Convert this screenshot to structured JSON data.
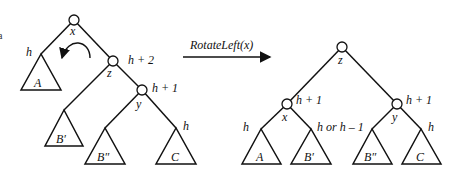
{
  "operation": {
    "label": "RotateLeft(x)",
    "arrow": {
      "x1": 183,
      "y1": 57,
      "x2": 270,
      "y2": 57
    }
  },
  "left_tree": {
    "nodes": [
      {
        "id": "x",
        "label": "x",
        "cx": 74,
        "cy": 20,
        "lx": 70,
        "ly": 35
      },
      {
        "id": "z",
        "label": "z",
        "cx": 113,
        "cy": 61,
        "lx": 107,
        "ly": 77,
        "height": "h + 2",
        "hx": 128,
        "hy": 64
      },
      {
        "id": "y",
        "label": "y",
        "cx": 142,
        "cy": 90,
        "lx": 136,
        "ly": 108,
        "height": "h + 1",
        "hx": 152,
        "hy": 92
      }
    ],
    "edges": [
      [
        74,
        20,
        41,
        54
      ],
      [
        74,
        20,
        113,
        61
      ],
      [
        113,
        61,
        64,
        110
      ],
      [
        113,
        61,
        142,
        90
      ],
      [
        142,
        90,
        105,
        128
      ],
      [
        142,
        90,
        176,
        128
      ]
    ],
    "subtrees": [
      {
        "name": "A",
        "apex": [
          41,
          54
        ],
        "base": [
          21,
          90,
          61,
          90
        ],
        "label_x": 34,
        "label_y": 87,
        "height": "h",
        "hx": 26,
        "hy": 56
      },
      {
        "name": "B′",
        "apex": [
          64,
          110
        ],
        "base": [
          45,
          146,
          83,
          146
        ],
        "label_x": 56,
        "label_y": 143
      },
      {
        "name": "B″",
        "apex": [
          105,
          128
        ],
        "base": [
          85,
          164,
          125,
          164
        ],
        "label_x": 97,
        "label_y": 161
      },
      {
        "name": "C",
        "apex": [
          176,
          128
        ],
        "base": [
          156,
          164,
          196,
          164
        ],
        "label_x": 171,
        "label_y": 161,
        "height": "h",
        "hx": 183,
        "hy": 130
      }
    ],
    "rotation_arrow": "curved-counterclockwise-arrow"
  },
  "right_tree": {
    "nodes": [
      {
        "id": "z",
        "label": "z",
        "cx": 342,
        "cy": 47,
        "lx": 338,
        "ly": 64
      },
      {
        "id": "x",
        "label": "x",
        "cx": 287,
        "cy": 104,
        "lx": 282,
        "ly": 121,
        "height": "h + 1",
        "hx": 296,
        "hy": 104
      },
      {
        "id": "y",
        "label": "y",
        "cx": 397,
        "cy": 104,
        "lx": 392,
        "ly": 121,
        "height": "h + 1",
        "hx": 406,
        "hy": 104
      }
    ],
    "edges": [
      [
        342,
        47,
        287,
        104
      ],
      [
        342,
        47,
        397,
        104
      ],
      [
        287,
        104,
        261,
        129
      ],
      [
        287,
        104,
        311,
        129
      ],
      [
        397,
        104,
        372,
        129
      ],
      [
        397,
        104,
        421,
        129
      ]
    ],
    "subtrees": [
      {
        "name": "A",
        "apex": [
          261,
          129
        ],
        "base": [
          242,
          164,
          281,
          164
        ],
        "label_x": 256,
        "label_y": 161,
        "height": "h",
        "hx": 243,
        "hy": 131
      },
      {
        "name": "B′",
        "apex": [
          311,
          129
        ],
        "base": [
          291,
          164,
          331,
          164
        ],
        "label_x": 304,
        "label_y": 161,
        "height": "h or h – 1",
        "hx": 317,
        "hy": 131
      },
      {
        "name": "B″",
        "apex": [
          372,
          129
        ],
        "base": [
          353,
          164,
          392,
          164
        ],
        "label_x": 364,
        "label_y": 161
      },
      {
        "name": "C",
        "apex": [
          421,
          129
        ],
        "base": [
          402,
          164,
          441,
          164
        ],
        "label_x": 416,
        "label_y": 161,
        "height": "h",
        "hx": 428,
        "hy": 131
      }
    ]
  },
  "edge_fragment": "a"
}
